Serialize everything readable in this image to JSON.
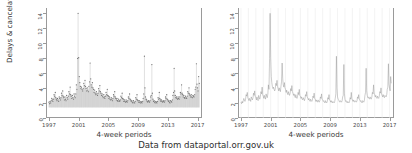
{
  "caption": "Data from dataportal.orr.gov.uk",
  "panels": [
    {
      "id": "left",
      "plot_type": "point-spike",
      "ylabel": "Delays & cancelations (%)",
      "xlabel": "4-week periods",
      "show_ylabel": true
    },
    {
      "id": "right",
      "plot_type": "line",
      "ylabel": "",
      "xlabel": "4-week periods",
      "show_ylabel": false
    }
  ],
  "axes": {
    "yticks": [
      0,
      2,
      4,
      6,
      8,
      10,
      12,
      14
    ],
    "ytick_labels": [
      "0",
      "2",
      "4",
      "6",
      "8",
      "10",
      "12",
      "14"
    ],
    "xticks": [
      1997,
      2001,
      2005,
      2009,
      2013,
      2017
    ],
    "xtick_labels": [
      "1997",
      "2001",
      "2005",
      "2009",
      "2013",
      "2017"
    ],
    "xlim": [
      1996.6,
      2017.6
    ],
    "ylim": [
      0,
      14.6
    ]
  },
  "chart_data": {
    "type": "line",
    "title": "",
    "subtitle": "",
    "xlabel": "4-week periods",
    "ylabel": "Delays & cancelations (%)",
    "xlim": [
      1996.6,
      2017.6
    ],
    "ylim": [
      0,
      14.6
    ],
    "xtick_labels": [
      "1997",
      "2001",
      "2005",
      "2009",
      "2013",
      "2017"
    ],
    "ytick_labels": [
      "0",
      "2",
      "4",
      "6",
      "8",
      "10",
      "12",
      "14"
    ],
    "grid": "vertical-minor-only-right-panel",
    "legend": "none",
    "annotations": [
      "Data from dataportal.orr.gov.uk"
    ],
    "x_unit": "4-week period (13 per year)",
    "series": [
      {
        "name": "Delays & cancelations (%)",
        "x": [
          1997.0,
          1997.08,
          1997.15,
          1997.23,
          1997.31,
          1997.38,
          1997.46,
          1997.54,
          1997.62,
          1997.69,
          1997.77,
          1997.85,
          1997.92,
          1998.0,
          1998.08,
          1998.15,
          1998.23,
          1998.31,
          1998.38,
          1998.46,
          1998.54,
          1998.62,
          1998.69,
          1998.77,
          1998.85,
          1998.92,
          1999.0,
          1999.08,
          1999.15,
          1999.23,
          1999.31,
          1999.38,
          1999.46,
          1999.54,
          1999.62,
          1999.69,
          1999.77,
          1999.85,
          1999.92,
          2000.0,
          2000.08,
          2000.15,
          2000.23,
          2000.31,
          2000.38,
          2000.46,
          2000.54,
          2000.62,
          2000.69,
          2000.77,
          2000.85,
          2000.92,
          2001.0,
          2001.08,
          2001.15,
          2001.23,
          2001.31,
          2001.38,
          2001.46,
          2001.54,
          2001.62,
          2001.69,
          2001.77,
          2001.85,
          2001.92,
          2002.0,
          2002.08,
          2002.15,
          2002.23,
          2002.31,
          2002.38,
          2002.46,
          2002.54,
          2002.62,
          2002.69,
          2002.77,
          2002.85,
          2002.92,
          2003.0,
          2003.08,
          2003.15,
          2003.23,
          2003.31,
          2003.38,
          2003.46,
          2003.54,
          2003.62,
          2003.69,
          2003.77,
          2003.85,
          2003.92,
          2004.0,
          2004.08,
          2004.15,
          2004.23,
          2004.31,
          2004.38,
          2004.46,
          2004.54,
          2004.62,
          2004.69,
          2004.77,
          2004.85,
          2004.92,
          2005.0,
          2005.08,
          2005.15,
          2005.23,
          2005.31,
          2005.38,
          2005.46,
          2005.54,
          2005.62,
          2005.69,
          2005.77,
          2005.85,
          2005.92,
          2006.0,
          2006.08,
          2006.15,
          2006.23,
          2006.31,
          2006.38,
          2006.46,
          2006.54,
          2006.62,
          2006.69,
          2006.77,
          2006.85,
          2006.92,
          2007.0,
          2007.08,
          2007.15,
          2007.23,
          2007.31,
          2007.38,
          2007.46,
          2007.54,
          2007.62,
          2007.69,
          2007.77,
          2007.85,
          2007.92,
          2008.0,
          2008.08,
          2008.15,
          2008.23,
          2008.31,
          2008.38,
          2008.46,
          2008.54,
          2008.62,
          2008.69,
          2008.77,
          2008.85,
          2008.92,
          2009.0,
          2009.08,
          2009.15,
          2009.23,
          2009.31,
          2009.38,
          2009.46,
          2009.54,
          2009.62,
          2009.69,
          2009.77,
          2009.85,
          2009.92,
          2010.0,
          2010.08,
          2010.15,
          2010.23,
          2010.31,
          2010.38,
          2010.46,
          2010.54,
          2010.62,
          2010.69,
          2010.77,
          2010.85,
          2010.92,
          2011.0,
          2011.08,
          2011.15,
          2011.23,
          2011.31,
          2011.38,
          2011.46,
          2011.54,
          2011.62,
          2011.69,
          2011.77,
          2011.85,
          2011.92,
          2012.0,
          2012.08,
          2012.15,
          2012.23,
          2012.31,
          2012.38,
          2012.46,
          2012.54,
          2012.62,
          2012.69,
          2012.77,
          2012.85,
          2012.92,
          2013.0,
          2013.08,
          2013.15,
          2013.23,
          2013.31,
          2013.38,
          2013.46,
          2013.54,
          2013.62,
          2013.69,
          2013.77,
          2013.85,
          2013.92,
          2014.0,
          2014.08,
          2014.15,
          2014.23,
          2014.31,
          2014.38,
          2014.46,
          2014.54,
          2014.62,
          2014.69,
          2014.77,
          2014.85,
          2014.92,
          2015.0,
          2015.08,
          2015.15,
          2015.23,
          2015.31,
          2015.38,
          2015.46,
          2015.54,
          2015.62,
          2015.69,
          2015.77,
          2015.85,
          2015.92,
          2016.0,
          2016.08,
          2016.15,
          2016.23,
          2016.31,
          2016.38,
          2016.46,
          2016.54,
          2016.62,
          2016.69,
          2016.77,
          2016.85,
          2016.92,
          2017.0,
          2017.08,
          2017.15,
          2017.23
        ],
        "values": [
          2.1,
          1.9,
          2.2,
          2.0,
          2.3,
          2.6,
          2.4,
          2.2,
          2.5,
          3.1,
          2.9,
          3.4,
          2.7,
          2.5,
          2.3,
          2.6,
          2.4,
          2.2,
          2.8,
          2.6,
          2.4,
          2.7,
          3.3,
          3.0,
          3.6,
          2.9,
          2.7,
          2.4,
          2.8,
          2.5,
          2.3,
          3.0,
          2.7,
          2.5,
          2.9,
          3.5,
          3.2,
          4.1,
          3.1,
          2.9,
          2.6,
          3.0,
          2.7,
          2.5,
          3.2,
          2.9,
          2.7,
          3.2,
          4.4,
          3.8,
          7.9,
          13.9,
          8.0,
          5.5,
          4.7,
          4.2,
          3.9,
          4.1,
          3.8,
          3.6,
          3.9,
          4.6,
          4.3,
          5.0,
          4.2,
          3.9,
          3.6,
          4.0,
          3.7,
          3.5,
          4.2,
          4.8,
          7.3,
          5.2,
          4.4,
          4.1,
          4.7,
          4.0,
          3.8,
          3.4,
          3.7,
          3.3,
          3.1,
          3.5,
          3.2,
          3.0,
          3.3,
          3.9,
          3.6,
          4.3,
          3.5,
          3.3,
          3.0,
          3.2,
          2.9,
          2.7,
          3.1,
          2.8,
          2.6,
          2.9,
          3.4,
          3.1,
          3.8,
          3.0,
          2.9,
          2.6,
          2.8,
          2.5,
          2.4,
          2.7,
          2.5,
          2.3,
          2.6,
          3.1,
          2.9,
          3.5,
          2.8,
          2.6,
          2.4,
          2.6,
          2.3,
          2.2,
          2.5,
          2.3,
          2.2,
          2.4,
          2.9,
          2.7,
          3.3,
          2.6,
          2.5,
          2.2,
          2.4,
          2.2,
          2.1,
          2.4,
          2.2,
          2.1,
          2.3,
          2.8,
          2.6,
          3.2,
          2.5,
          2.4,
          2.2,
          2.3,
          2.1,
          2.0,
          2.3,
          2.1,
          2.0,
          2.2,
          2.7,
          2.5,
          3.1,
          2.4,
          2.3,
          2.1,
          2.3,
          2.1,
          2.0,
          2.2,
          2.1,
          2.0,
          2.2,
          2.6,
          3.2,
          8.2,
          4.0,
          2.8,
          2.5,
          2.4,
          2.2,
          2.1,
          2.3,
          2.2,
          2.1,
          2.3,
          2.8,
          3.0,
          7.1,
          3.3,
          2.5,
          2.2,
          2.3,
          2.1,
          2.0,
          2.2,
          2.1,
          2.0,
          2.2,
          2.7,
          2.5,
          3.4,
          2.6,
          2.4,
          2.2,
          2.4,
          2.2,
          2.1,
          2.3,
          2.2,
          2.1,
          2.3,
          2.8,
          2.6,
          3.1,
          2.5,
          2.4,
          2.2,
          2.3,
          2.1,
          2.0,
          2.3,
          2.2,
          2.1,
          2.4,
          3.0,
          3.4,
          6.6,
          3.6,
          3.0,
          2.7,
          2.8,
          2.6,
          2.5,
          2.8,
          2.6,
          2.5,
          2.8,
          3.4,
          3.2,
          4.4,
          3.3,
          3.1,
          2.8,
          3.0,
          2.7,
          2.6,
          2.9,
          2.7,
          2.6,
          2.9,
          3.5,
          3.3,
          4.0,
          3.2,
          3.0,
          2.8,
          3.1,
          2.8,
          2.7,
          3.0,
          2.9,
          2.8,
          3.1,
          3.8,
          4.1,
          7.2,
          4.5,
          4.0,
          3.6,
          5.5,
          4.6
        ]
      }
    ]
  }
}
